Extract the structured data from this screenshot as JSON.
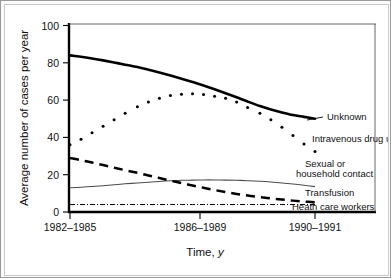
{
  "chart_data": {
    "type": "line",
    "title": "",
    "xlabel": "Time, y",
    "ylabel": "Average number of cases per year",
    "xlabel_italic_suffix": "y",
    "xlabel_prefix": "Time, ",
    "grid": false,
    "legend_position": "right-inline-annotations",
    "ylim": [
      0,
      100
    ],
    "yticks": [
      0,
      20,
      40,
      60,
      80,
      100
    ],
    "ytick_labels": [
      "0",
      "20",
      "40",
      "60",
      "80",
      "100"
    ],
    "xticks": [
      0,
      1,
      2
    ],
    "xtick_labels": [
      "1982–1985",
      "1986–1989",
      "1990–1991"
    ],
    "x": [
      0,
      0.09,
      0.18,
      0.27,
      0.36,
      0.45,
      0.55,
      0.64,
      0.73,
      0.82,
      0.91,
      1.0,
      1.09,
      1.18,
      1.27,
      1.36,
      1.45,
      1.55,
      1.64,
      1.73,
      1.82,
      1.91,
      2.0
    ],
    "series": [
      {
        "name": "Unknown",
        "style": "solid-thick",
        "label": "Unknown",
        "values": [
          84,
          83.2,
          82.3,
          81.3,
          80.2,
          79.0,
          77.7,
          76.3,
          74.8,
          73.2,
          71.5,
          69.7,
          67.8,
          65.8,
          63.7,
          61.5,
          59.2,
          56.8,
          55.0,
          53.4,
          52.0,
          51.0,
          50.0
        ]
      },
      {
        "name": "Intravenous drug use",
        "style": "dotted",
        "label": "Intravenous drug use",
        "values": [
          36,
          39,
          42.5,
          46,
          49.5,
          53,
          56.5,
          59,
          61,
          62.5,
          63.2,
          63.4,
          63.0,
          62.0,
          61.0,
          59.0,
          56.0,
          53.0,
          49.5,
          45.5,
          41.0,
          36.5,
          32.5
        ]
      },
      {
        "name": "Sexual or household contact",
        "style": "solid-thin",
        "label": "Sexual or household contact",
        "values": [
          13.0,
          13.3,
          13.7,
          14.1,
          14.6,
          15.1,
          15.6,
          16.0,
          16.4,
          16.7,
          17.0,
          17.1,
          17.2,
          17.2,
          17.1,
          17.0,
          16.8,
          16.5,
          16.1,
          15.6,
          15.0,
          14.3,
          13.6
        ]
      },
      {
        "name": "Transfusion",
        "style": "dashed-thick",
        "label": "Transfusion",
        "values": [
          29.0,
          27.8,
          26.5,
          25.2,
          23.8,
          22.4,
          21.0,
          19.6,
          18.2,
          16.8,
          15.5,
          14.2,
          13.0,
          11.8,
          10.7,
          9.7,
          8.8,
          8.0,
          7.3,
          6.7,
          6.1,
          5.6,
          5.2
        ]
      },
      {
        "name": "Heath care workers",
        "style": "dash-dot-thin",
        "label": "Heath care workers",
        "values": [
          4.0,
          4.0,
          4.0,
          4.0,
          4.0,
          4.0,
          4.0,
          4.0,
          4.0,
          4.0,
          4.0,
          4.0,
          4.0,
          4.0,
          4.0,
          4.0,
          4.0,
          4.0,
          4.0,
          4.0,
          4.0,
          4.0,
          4.0
        ]
      }
    ],
    "annotations": [
      {
        "text": "Unknown",
        "series": "Unknown"
      },
      {
        "text": "Intravenous drug use",
        "series": "Intravenous drug use"
      },
      {
        "text": "Sexual or",
        "series": "Sexual or household contact"
      },
      {
        "text": "household contact",
        "series": "Sexual or household contact"
      },
      {
        "text": "Transfusion",
        "series": "Transfusion"
      },
      {
        "text": "Heath care workers",
        "series": "Heath care workers"
      }
    ],
    "colors": {
      "axis": "#000000",
      "unknown": "#000000",
      "intravenous_drug_use": "#000000",
      "sexual_or_household_contact": "#4d4d4d",
      "transfusion": "#000000",
      "heath_care_workers": "#000000",
      "background": "#ffffff",
      "frame": "#9a9a9a"
    }
  }
}
